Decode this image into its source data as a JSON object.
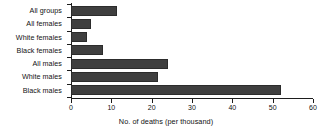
{
  "chart_data": {
    "type": "bar",
    "orientation": "horizontal",
    "title": "",
    "subtitle": "",
    "categories": [
      "All groups",
      "All females",
      "White females",
      "Black females",
      "All males",
      "White males",
      "Black males"
    ],
    "values": [
      11.5,
      5,
      4,
      8,
      24,
      21.5,
      52
    ],
    "xlabel": "No. of deaths (per thousand)",
    "ylabel": "",
    "xlim": [
      0,
      60
    ],
    "xticks": [
      0,
      10,
      20,
      30,
      40,
      50,
      60
    ],
    "xticklabels": [
      "0",
      "10",
      "20",
      "30",
      "40",
      "50",
      "60"
    ],
    "grid": false,
    "legend": false,
    "bar_color": "#3f3f3f",
    "axis_color": "#1d1d1d",
    "text_color": "#121212",
    "background": "#ffffff"
  }
}
